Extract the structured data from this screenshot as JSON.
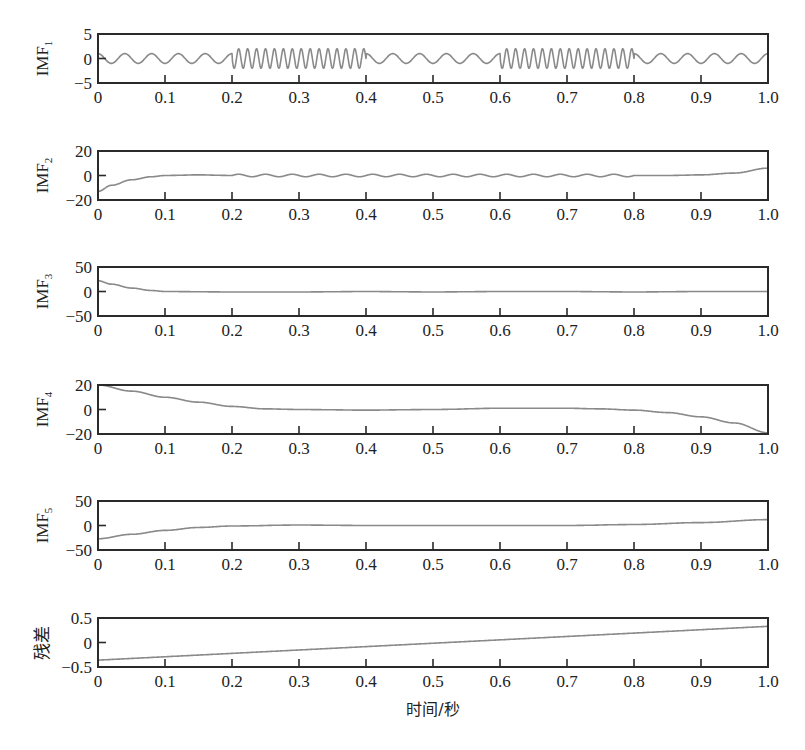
{
  "chart_data": {
    "type": "line",
    "title": "",
    "xlabel": "时间/秒",
    "x_ticks": [
      "0",
      "0.1",
      "0.2",
      "0.3",
      "0.4",
      "0.5",
      "0.6",
      "0.7",
      "0.8",
      "0.9",
      "1.0"
    ],
    "xlim": [
      0,
      1.0
    ],
    "grid": false,
    "legend": null,
    "subplots": [
      {
        "name": "IMF1",
        "ylabel_main": "IMF",
        "ylabel_sub": "1",
        "ylim": [
          -5,
          5
        ],
        "y_ticks": [
          "5",
          "0",
          "−5"
        ],
        "description": "Intermittent oscillation: ~25 Hz, amplitude ~1 in [0,0.2],[0.4,0.6],[0.8,1.0]; ~75 Hz, amplitude ~2 in [0.2,0.4],[0.6,0.8]",
        "components": [
          {
            "x_start": 0.0,
            "x_end": 0.2,
            "freq_hz": 25,
            "amp": 1.0
          },
          {
            "x_start": 0.2,
            "x_end": 0.4,
            "freq_hz": 75,
            "amp": 2.0
          },
          {
            "x_start": 0.4,
            "x_end": 0.6,
            "freq_hz": 25,
            "amp": 1.0
          },
          {
            "x_start": 0.6,
            "x_end": 0.8,
            "freq_hz": 75,
            "amp": 2.0
          },
          {
            "x_start": 0.8,
            "x_end": 1.0,
            "freq_hz": 25,
            "amp": 1.0
          }
        ]
      },
      {
        "name": "IMF2",
        "ylabel_main": "IMF",
        "ylabel_sub": "2",
        "ylim": [
          -20,
          20
        ],
        "y_ticks": [
          "20",
          "0",
          "−20"
        ],
        "x": [
          0,
          0.02,
          0.05,
          0.08,
          0.1,
          0.15,
          0.2,
          0.3,
          0.4,
          0.5,
          0.6,
          0.7,
          0.8,
          0.85,
          0.9,
          0.95,
          1.0
        ],
        "y": [
          -13,
          -8,
          -3.5,
          -1,
          0,
          0.5,
          0,
          0,
          0,
          0,
          0,
          0,
          0,
          0,
          0.5,
          2,
          6
        ],
        "ripple": {
          "x_start": 0.2,
          "x_end": 0.8,
          "freq_hz": 25,
          "amp": 1.0
        }
      },
      {
        "name": "IMF3",
        "ylabel_main": "IMF",
        "ylabel_sub": "3",
        "ylim": [
          -50,
          50
        ],
        "y_ticks": [
          "50",
          "0",
          "−50"
        ],
        "x": [
          0,
          0.02,
          0.05,
          0.08,
          0.1,
          0.2,
          0.3,
          0.4,
          0.5,
          0.6,
          0.7,
          0.8,
          0.9,
          1.0
        ],
        "y": [
          22,
          15,
          7,
          2,
          0,
          -1,
          -1,
          0,
          -1,
          0,
          0,
          -1,
          0,
          0
        ]
      },
      {
        "name": "IMF4",
        "ylabel_main": "IMF",
        "ylabel_sub": "4",
        "ylim": [
          -20,
          20
        ],
        "y_ticks": [
          "20",
          "0",
          "−20"
        ],
        "x": [
          0,
          0.05,
          0.1,
          0.15,
          0.2,
          0.25,
          0.3,
          0.4,
          0.5,
          0.6,
          0.7,
          0.75,
          0.8,
          0.85,
          0.9,
          0.95,
          1.0
        ],
        "y": [
          20,
          15,
          10,
          6,
          2.5,
          0.5,
          0,
          -0.5,
          0,
          1,
          1,
          0.5,
          -0.5,
          -2.5,
          -6,
          -11,
          -19
        ]
      },
      {
        "name": "IMF5",
        "ylabel_main": "IMF",
        "ylabel_sub": "5",
        "ylim": [
          -50,
          50
        ],
        "y_ticks": [
          "50",
          "0",
          "−50"
        ],
        "x": [
          0,
          0.05,
          0.1,
          0.15,
          0.2,
          0.3,
          0.4,
          0.5,
          0.6,
          0.7,
          0.8,
          0.9,
          1.0
        ],
        "y": [
          -27,
          -18,
          -10,
          -4,
          -1,
          1,
          0,
          0,
          0,
          0,
          2,
          6,
          12
        ]
      },
      {
        "name": "残差",
        "ylabel_main": "残差",
        "ylabel_sub": "",
        "ylim": [
          -0.5,
          0.5
        ],
        "y_ticks": [
          "0.5",
          "0",
          "−0.5"
        ],
        "x": [
          0,
          1.0
        ],
        "y": [
          -0.36,
          0.33
        ]
      }
    ]
  }
}
